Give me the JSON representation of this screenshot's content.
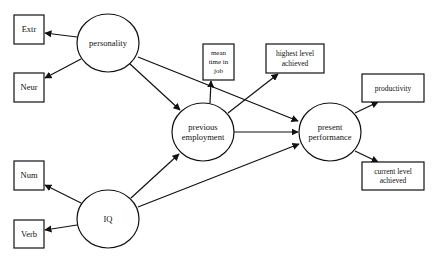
{
  "diagram": {
    "type": "path-model",
    "colors": {
      "stroke": "#111111",
      "background": "#ffffff"
    },
    "latent": [
      {
        "id": "personality",
        "label": [
          "personality"
        ],
        "cx": 108,
        "cy": 43,
        "rx": 31,
        "ry": 29
      },
      {
        "id": "iq",
        "label": [
          "IQ"
        ],
        "cx": 108,
        "cy": 219,
        "rx": 31,
        "ry": 29
      },
      {
        "id": "previous-employment",
        "label": [
          "previous",
          "employment"
        ],
        "cx": 203,
        "cy": 132,
        "rx": 31,
        "ry": 29
      },
      {
        "id": "present-performance",
        "label": [
          "present",
          "performance"
        ],
        "cx": 330,
        "cy": 132,
        "rx": 31,
        "ry": 29
      }
    ],
    "observed": [
      {
        "id": "extr",
        "label": [
          "Extr"
        ],
        "x": 14,
        "y": 15,
        "w": 30,
        "h": 29
      },
      {
        "id": "neur",
        "label": [
          "Neur"
        ],
        "x": 14,
        "y": 73,
        "w": 30,
        "h": 29
      },
      {
        "id": "num",
        "label": [
          "Num"
        ],
        "x": 14,
        "y": 161,
        "w": 30,
        "h": 29
      },
      {
        "id": "verb",
        "label": [
          "Verb"
        ],
        "x": 14,
        "y": 220,
        "w": 30,
        "h": 28
      },
      {
        "id": "mean-time-in-job",
        "label": [
          "mean",
          "time in",
          "job"
        ],
        "x": 203,
        "y": 44,
        "w": 31,
        "h": 36
      },
      {
        "id": "highest-level-achieved",
        "label": [
          "highest level",
          "achieved"
        ],
        "x": 266,
        "y": 44,
        "w": 58,
        "h": 29
      },
      {
        "id": "productivity",
        "label": [
          "productivity"
        ],
        "x": 362,
        "y": 74,
        "w": 62,
        "h": 28
      },
      {
        "id": "current-level-achieved",
        "label": [
          "current level",
          "achieved"
        ],
        "x": 362,
        "y": 162,
        "w": 62,
        "h": 28
      }
    ],
    "arrows": [
      {
        "from": "personality",
        "to": "extr",
        "x1": 77,
        "y1": 37,
        "x2": 45,
        "y2": 33
      },
      {
        "from": "personality",
        "to": "neur",
        "x1": 81,
        "y1": 59,
        "x2": 45,
        "y2": 78
      },
      {
        "from": "personality",
        "to": "previous-employment",
        "x1": 130,
        "y1": 64,
        "x2": 180,
        "y2": 110
      },
      {
        "from": "personality",
        "to": "present-performance",
        "x1": 138,
        "y1": 57,
        "x2": 298,
        "y2": 121
      },
      {
        "from": "iq",
        "to": "num",
        "x1": 81,
        "y1": 203,
        "x2": 45,
        "y2": 185
      },
      {
        "from": "iq",
        "to": "verb",
        "x1": 77,
        "y1": 225,
        "x2": 45,
        "y2": 230
      },
      {
        "from": "iq",
        "to": "previous-employment",
        "x1": 131,
        "y1": 198,
        "x2": 179,
        "y2": 154
      },
      {
        "from": "iq",
        "to": "present-performance",
        "x1": 138,
        "y1": 207,
        "x2": 299,
        "y2": 144
      },
      {
        "from": "previous-employment",
        "to": "mean-time-in-job",
        "x1": 210,
        "y1": 103,
        "x2": 211,
        "y2": 81
      },
      {
        "from": "previous-employment",
        "to": "highest-level-achieved",
        "x1": 228,
        "y1": 113,
        "x2": 278,
        "y2": 74
      },
      {
        "from": "previous-employment",
        "to": "present-performance",
        "x1": 234,
        "y1": 132,
        "x2": 298,
        "y2": 132
      },
      {
        "from": "present-performance",
        "to": "productivity",
        "x1": 355,
        "y1": 113,
        "x2": 378,
        "y2": 102
      },
      {
        "from": "present-performance",
        "to": "current-level-achieved",
        "x1": 355,
        "y1": 151,
        "x2": 378,
        "y2": 162
      }
    ]
  }
}
